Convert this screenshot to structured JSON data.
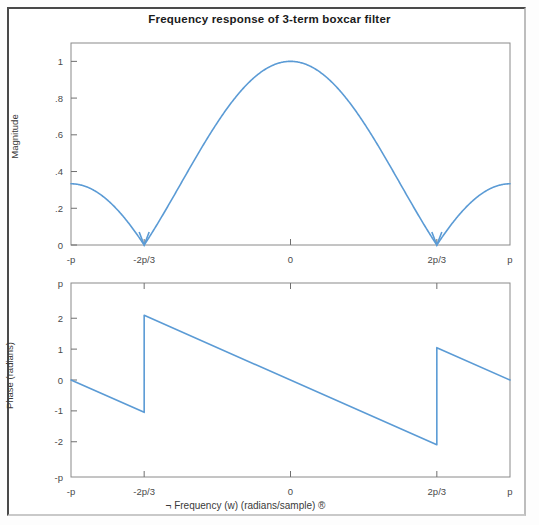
{
  "figure": {
    "title": "Frequency response of 3-term boxcar filter",
    "line_color": "#5b9bd5",
    "frame_color": "#8a8a8a",
    "background": "#ffffff"
  },
  "chart_data": [
    {
      "type": "line",
      "id": "magnitude-response",
      "title": "Frequency response of 3-term boxcar filter",
      "xlabel": "",
      "ylabel": "Magnitude",
      "xlim": [
        -3.14159,
        3.14159
      ],
      "ylim": [
        0,
        1.1
      ],
      "grid": false,
      "legend": null,
      "xtick_labels": [
        "-p",
        "-2p/3",
        "0",
        "2p/3",
        "p"
      ],
      "xtick_values": [
        -3.14159,
        -2.0944,
        0,
        2.0944,
        3.14159
      ],
      "ytick_labels": [
        "0",
        ".2",
        ".4",
        ".6",
        ".8",
        "1"
      ],
      "ytick_values": [
        0,
        0.2,
        0.4,
        0.6,
        0.8,
        1
      ],
      "x": [
        -3.14159,
        -2.96706,
        -2.79253,
        -2.61799,
        -2.44346,
        -2.26893,
        -2.0944,
        -1.91986,
        -1.74533,
        -1.5708,
        -1.39626,
        -1.22173,
        -1.0472,
        -0.87266,
        -0.69813,
        -0.5236,
        -0.34907,
        -0.17453,
        0,
        0.17453,
        0.34907,
        0.5236,
        0.69813,
        0.87266,
        1.0472,
        1.22173,
        1.39626,
        1.5708,
        1.74533,
        1.91986,
        2.0944,
        2.26893,
        2.44346,
        2.61799,
        2.79253,
        2.96706,
        3.14159
      ],
      "y": [
        0.3333,
        0.3229,
        0.2919,
        0.2418,
        0.1752,
        0.0954,
        0.0,
        0.1021,
        0.2029,
        0.3333,
        0.4494,
        0.5621,
        0.6667,
        0.7596,
        0.8376,
        0.8981,
        0.9391,
        0.9592,
        1.0,
        0.9592,
        0.9391,
        0.8981,
        0.8376,
        0.7596,
        0.6667,
        0.5621,
        0.4494,
        0.3333,
        0.2029,
        0.1021,
        0.0,
        0.0954,
        0.1752,
        0.2418,
        0.2919,
        0.3229,
        0.3333
      ]
    },
    {
      "type": "line",
      "id": "phase-response",
      "title": "",
      "xlabel": "¬ Frequency (w) (radians/sample) ®",
      "ylabel": "Phase (radians)",
      "xlim": [
        -3.14159,
        3.14159
      ],
      "ylim": [
        -3.14159,
        3.14159
      ],
      "grid": false,
      "legend": null,
      "xtick_labels": [
        "-p",
        "-2p/3",
        "0",
        "2p/3",
        "p"
      ],
      "xtick_values": [
        -3.14159,
        -2.0944,
        0,
        2.0944,
        3.14159
      ],
      "ytick_labels": [
        "-p",
        "-2",
        "-1",
        "0",
        "1",
        "2",
        "p"
      ],
      "ytick_values": [
        -3.14159,
        -2,
        -1,
        0,
        1,
        2,
        3.14159
      ],
      "segments": [
        {
          "name": "branch-left",
          "x": [
            -3.14159,
            -2.0944
          ],
          "y": [
            0.0,
            -1.0472
          ]
        },
        {
          "name": "jump-at-minus-2p3",
          "x": [
            -2.0944,
            -2.0944
          ],
          "y": [
            -1.0472,
            2.0944
          ]
        },
        {
          "name": "branch-middle",
          "x": [
            -2.0944,
            2.0944
          ],
          "y": [
            2.0944,
            -2.0944
          ]
        },
        {
          "name": "jump-at-2p3",
          "x": [
            2.0944,
            2.0944
          ],
          "y": [
            -2.0944,
            1.0472
          ]
        },
        {
          "name": "branch-right",
          "x": [
            2.0944,
            3.14159
          ],
          "y": [
            1.0472,
            0.0
          ]
        }
      ]
    }
  ],
  "magnitude_plot": {
    "ylabel": "Magnitude",
    "yticks": [
      "1",
      ".8",
      ".6",
      ".4",
      ".2",
      "0"
    ],
    "xticks": [
      "-p",
      "-2p/3",
      "0",
      "2p/3",
      "p"
    ]
  },
  "phase_plot": {
    "ylabel": "Phase (radians)",
    "yticks": [
      "p",
      "2",
      "1",
      "0",
      "-1",
      "-2",
      "-p"
    ],
    "xticks": [
      "-p",
      "-2p/3",
      "0",
      "2p/3",
      "p"
    ],
    "xlabel": "¬ Frequency (w) (radians/sample) ®"
  }
}
